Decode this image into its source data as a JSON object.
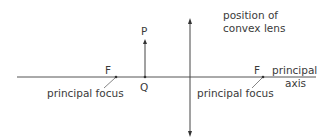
{
  "diagram": {
    "labels": {
      "lens_position": [
        "position of",
        "convex lens"
      ],
      "point_p": "P",
      "point_q": "Q",
      "focus_left": "F",
      "focus_right": "F",
      "principal_focus_left": "principal focus",
      "principal_focus_right": "principal focus",
      "principal_axis": [
        "principal",
        "axis"
      ]
    },
    "colors": {
      "line": "#444444",
      "background": "#ffffff"
    }
  }
}
